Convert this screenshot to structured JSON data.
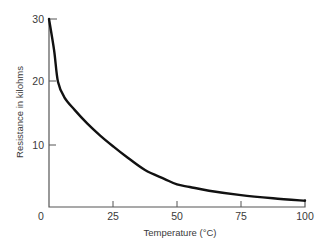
{
  "chart_data": {
    "type": "line",
    "title": "",
    "xlabel": "Temperature (°C)",
    "ylabel": "Resistance in kilohms",
    "xlim": [
      0,
      100
    ],
    "ylim": [
      0,
      30
    ],
    "x_ticks": [
      0,
      25,
      50,
      75,
      100
    ],
    "x_tick_labels": [
      "0",
      "25",
      "50",
      "75",
      "100"
    ],
    "y_ticks": [
      10,
      20,
      30
    ],
    "y_tick_labels": [
      "10",
      "20",
      "30"
    ],
    "grid": false,
    "legend": null,
    "series": [
      {
        "name": "Thermistor resistance",
        "color": "#111111",
        "x": [
          0,
          2,
          3.5,
          6,
          10,
          15,
          20,
          25,
          30,
          37.5,
          45,
          50,
          55,
          62.5,
          75,
          87.5,
          100
        ],
        "y": [
          30,
          25,
          20,
          17.5,
          15.5,
          13.3,
          11.4,
          9.7,
          8.1,
          5.9,
          4.5,
          3.6,
          3.2,
          2.6,
          1.9,
          1.4,
          1.0
        ]
      }
    ]
  },
  "labels": {
    "xlabel": "Temperature (°C)",
    "ylabel": "Resistance in kilohms",
    "x_ticks": [
      "0",
      "25",
      "50",
      "75",
      "100"
    ],
    "y_ticks": [
      "10",
      "20",
      "30"
    ]
  }
}
